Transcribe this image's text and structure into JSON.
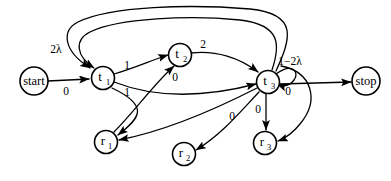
{
  "diagram": {
    "type": "state-transition-diagram",
    "width": 391,
    "height": 181,
    "background_color": "#ffffff",
    "stroke_color": "#000000",
    "nodes": [
      {
        "id": "start",
        "label": "start",
        "kind": "word",
        "cx": 34,
        "cy": 81,
        "r": 14
      },
      {
        "id": "t1",
        "label": "t",
        "sub": "1",
        "kind": "sym",
        "cx": 103,
        "cy": 78,
        "r": 11.5
      },
      {
        "id": "t2",
        "label": "t",
        "sub": "2",
        "kind": "sym",
        "cx": 180,
        "cy": 55,
        "r": 11.5
      },
      {
        "id": "t3",
        "label": "t",
        "sub": "3",
        "kind": "sym",
        "cx": 268,
        "cy": 82,
        "r": 11.5
      },
      {
        "id": "r1",
        "label": "r",
        "sub": "1",
        "kind": "sym",
        "cx": 106,
        "cy": 142,
        "r": 11.5
      },
      {
        "id": "r2",
        "label": "r",
        "sub": "2",
        "kind": "sym",
        "cx": 184,
        "cy": 154,
        "r": 11.5
      },
      {
        "id": "r3",
        "label": "r",
        "sub": "3",
        "kind": "sym",
        "cx": 265,
        "cy": 143,
        "r": 11.5
      },
      {
        "id": "stop",
        "label": "stop",
        "kind": "word",
        "cx": 366,
        "cy": 81,
        "r": 14
      }
    ],
    "edges": [
      {
        "id": "start-t1",
        "from": "start",
        "to": "t1",
        "label": "0",
        "label_x": 66,
        "label_y": 92
      },
      {
        "id": "t1-t2",
        "from": "t1",
        "to": "t2",
        "label": "1",
        "label_x": 127,
        "label_y": 66
      },
      {
        "id": "t1-r1",
        "from": "t1",
        "to": "r1",
        "label": "1",
        "label_x": 127,
        "label_y": 93
      },
      {
        "id": "t2-t3",
        "from": "t2",
        "to": "t3",
        "label": "2",
        "label_x": 203,
        "label_y": 45
      },
      {
        "id": "r1-t2",
        "from": "r1",
        "to": "t2",
        "label": "0",
        "label_x": 175,
        "label_y": 78
      },
      {
        "id": "t1-t3",
        "from": "t1",
        "to": "t3",
        "label": "",
        "label_x": 0,
        "label_y": 0
      },
      {
        "id": "t3-r1",
        "from": "t3",
        "to": "r1",
        "label": "",
        "label_x": 0,
        "label_y": 0
      },
      {
        "id": "t3-loop",
        "from": "t3",
        "to": "t3",
        "label": "1−2λ",
        "label_x": 290,
        "label_y": 62
      },
      {
        "id": "t3-stop",
        "from": "t3",
        "to": "stop",
        "label": "0",
        "label_x": 288,
        "label_y": 92
      },
      {
        "id": "t3-r2",
        "from": "t3",
        "to": "r2",
        "label": "0",
        "label_x": 232,
        "label_y": 117
      },
      {
        "id": "t3-r3",
        "from": "t3",
        "to": "r3",
        "label": "0",
        "label_x": 258,
        "label_y": 110
      },
      {
        "id": "t3-t1-outer",
        "from": "t3",
        "to": "t1",
        "label": "2λ",
        "label_x": 56,
        "label_y": 50
      },
      {
        "id": "t3-t1-inner",
        "from": "t3",
        "to": "t1",
        "label": "",
        "label_x": 0,
        "label_y": 0
      },
      {
        "id": "t3-r3-arc",
        "from": "t3",
        "to": "r3",
        "label": "",
        "label_x": 0,
        "label_y": 0
      }
    ]
  }
}
